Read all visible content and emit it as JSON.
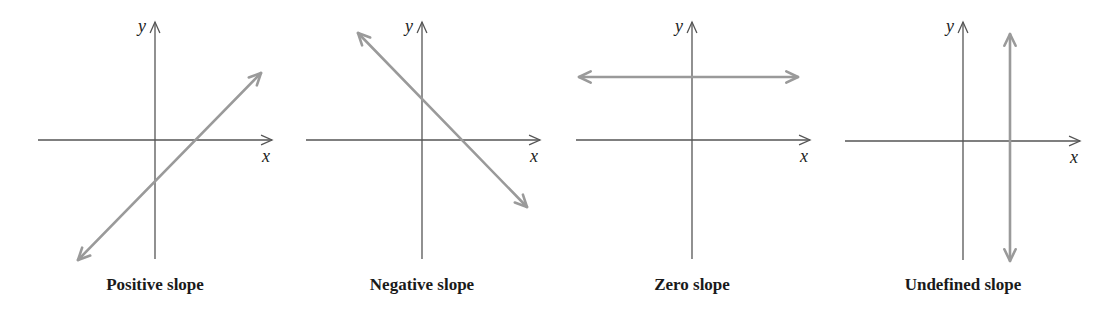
{
  "figure": {
    "colors": {
      "background": "#ffffff",
      "axis": "#555555",
      "line": "#9a9a9a",
      "text": "#1a1a1a"
    }
  },
  "panels": [
    {
      "id": "positive",
      "caption": "Positive slope",
      "x_label": "x",
      "y_label": "y",
      "origin": [
        155,
        140
      ],
      "x_axis": {
        "from": 38,
        "to": 272
      },
      "y_axis": {
        "from": 259,
        "to": 22
      },
      "line": {
        "x1": 78,
        "y1": 260,
        "x2": 261,
        "y2": 73,
        "double_arrow": true
      },
      "caption_x": 155
    },
    {
      "id": "negative",
      "caption": "Negative slope",
      "x_label": "x",
      "y_label": "y",
      "origin": [
        422,
        140
      ],
      "x_axis": {
        "from": 306,
        "to": 540
      },
      "y_axis": {
        "from": 259,
        "to": 22
      },
      "line": {
        "x1": 358,
        "y1": 33,
        "x2": 527,
        "y2": 207,
        "double_arrow": true
      },
      "caption_x": 422
    },
    {
      "id": "zero",
      "caption": "Zero slope",
      "x_label": "x",
      "y_label": "y",
      "origin": [
        692,
        140
      ],
      "x_axis": {
        "from": 576,
        "to": 810
      },
      "y_axis": {
        "from": 259,
        "to": 22
      },
      "line": {
        "x1": 579,
        "y1": 77,
        "x2": 798,
        "y2": 77,
        "double_arrow": true
      },
      "caption_x": 692
    },
    {
      "id": "undefined",
      "caption": "Undefined slope",
      "x_label": "x",
      "y_label": "y",
      "origin": [
        963,
        141
      ],
      "x_axis": {
        "from": 845,
        "to": 1080
      },
      "y_axis": {
        "from": 260,
        "to": 22
      },
      "line": {
        "x1": 1010,
        "y1": 34,
        "x2": 1010,
        "y2": 261,
        "double_arrow": true
      },
      "caption_x": 963
    }
  ]
}
